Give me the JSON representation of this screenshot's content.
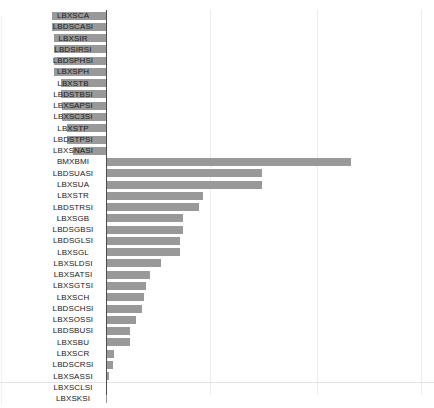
{
  "figure": {
    "header_fragment": "",
    "background_color": "#ffffff",
    "bar_color": "#999999",
    "axis_color": "#4d4d4d",
    "grid_color": "#ededed"
  },
  "chart_data": {
    "type": "bar",
    "orientation": "horizontal",
    "title": "",
    "subtitle": "",
    "xlabel": "",
    "ylabel": "",
    "xlim": [
      0,
      1
    ],
    "grid": true,
    "grid_axis": "x",
    "legend": false,
    "legend_position": "none",
    "xtick_labels": [],
    "gridline_values": [
      0.333,
      0.667,
      1.0
    ],
    "note": "Bars for the top 13 categories extend to the left of the axis (negative direction) and are overlaid by their category labels; the remaining categories extend to the right.",
    "categories": [
      "LBXSCA",
      "LBDSCASI",
      "LBXSIR",
      "LBDSIRSI",
      "LBDSPHSI",
      "LBXSPH",
      "LBXSTB",
      "LBDSTBSI",
      "LBXSAPSI",
      "LBXSC3SI",
      "LBXSTP",
      "LBDSTPSI",
      "LBXSNASI",
      "BMXBMI",
      "LBDSUASI",
      "LBXSUA",
      "LBXSTR",
      "LBDSTRSI",
      "LBXSGB",
      "LBDSGBSI",
      "LBDSGLSI",
      "LBXSGL",
      "LBXSLDSI",
      "LBXSATSI",
      "LBXSGTSI",
      "LBXSCH",
      "LBDSCHSI",
      "LBXSOSSI",
      "LBDSBUSI",
      "LBXSBU",
      "LBXSCR",
      "LBDSCRSI",
      "LBXSASSI",
      "LBXSCLSI",
      "LBXSKSI"
    ],
    "values": [
      -0.192,
      -0.192,
      -0.186,
      -0.186,
      -0.183,
      -0.183,
      -0.158,
      -0.158,
      -0.155,
      -0.155,
      -0.14,
      -0.14,
      -0.118,
      0.868,
      0.553,
      0.553,
      0.343,
      0.331,
      0.274,
      0.274,
      0.261,
      0.261,
      0.196,
      0.156,
      0.143,
      0.134,
      0.128,
      0.105,
      0.086,
      0.086,
      0.029,
      0.026,
      0.01,
      0.005,
      0.005
    ]
  }
}
